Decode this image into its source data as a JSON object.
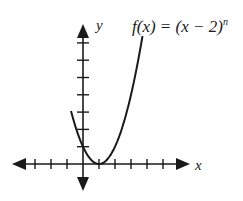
{
  "chart_data": {
    "type": "line",
    "title_parts": {
      "lhs": "f(x) = (x − 2)",
      "exponent": "n"
    },
    "xlabel": "x",
    "ylabel": "y",
    "xlim": [
      -4,
      6
    ],
    "ylim": [
      -2,
      8
    ],
    "x_ticks": [
      -3,
      -2,
      -1,
      1,
      2,
      3,
      4,
      5
    ],
    "y_ticks": [
      1,
      2,
      3,
      4,
      5,
      6,
      7
    ],
    "grid": false,
    "legend": "none",
    "series": [
      {
        "name": "f(x) = (x-2)^n",
        "x": [
          -1,
          -0.5,
          0,
          0.5,
          1,
          1.5,
          2,
          2.5,
          3,
          3.5,
          4,
          4.5,
          5
        ],
        "y": [
          8,
          5.8,
          4,
          2.3,
          1,
          0.25,
          0,
          0.25,
          1,
          2.3,
          4,
          5.8,
          8
        ]
      }
    ],
    "annotations": [
      {
        "text": "y",
        "role": "y-axis-label"
      },
      {
        "text": "x",
        "role": "x-axis-label"
      }
    ]
  }
}
